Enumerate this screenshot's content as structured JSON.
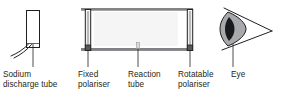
{
  "diagram": {
    "colors": {
      "line": "#231f20",
      "rail": "#6d6e71",
      "polariser_fill": "#a7a9ac",
      "tube_fill": "#f4f4f4",
      "iris_fill": "#a7a9ac",
      "pupil_fill": "#1a1a1a",
      "text": "#231f20",
      "background": "#ffffff"
    },
    "parts": [
      {
        "id": "sodium-discharge-tube",
        "label": "Sodium\ndischarge tube",
        "label_lines": [
          "Sodium",
          "discharge tube"
        ],
        "leader_x": 33
      },
      {
        "id": "fixed-polariser",
        "label": "Fixed\npolariser",
        "label_lines": [
          "Fixed",
          "polariser"
        ],
        "leader_x": 88
      },
      {
        "id": "reaction-tube",
        "label": "Reaction\ntube",
        "label_lines": [
          "Reaction",
          "tube"
        ],
        "leader_x": 138
      },
      {
        "id": "rotatable-polariser",
        "label": "Rotatable\npolariser",
        "label_lines": [
          "Rotatable",
          "polariser"
        ],
        "leader_x": 190
      },
      {
        "id": "eye",
        "label": "Eye",
        "label_lines": [
          "Eye"
        ],
        "leader_x": 233
      }
    ]
  }
}
